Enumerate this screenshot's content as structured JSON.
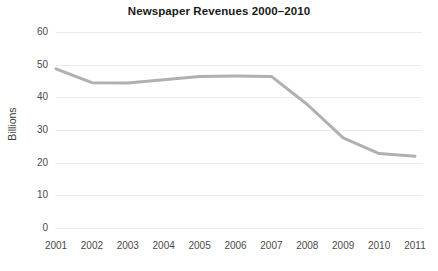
{
  "chart_data": {
    "type": "line",
    "title": "Newspaper Revenues 2000–2010",
    "xlabel": "",
    "ylabel": "Billions",
    "categories": [
      "2001",
      "2002",
      "2003",
      "2004",
      "2005",
      "2006",
      "2007",
      "2008",
      "2009",
      "2010",
      "2011"
    ],
    "x": [
      2001,
      2002,
      2003,
      2004,
      2005,
      2006,
      2007,
      2008,
      2009,
      2010,
      2011
    ],
    "values": [
      48.7,
      44.5,
      44.4,
      45.4,
      46.4,
      46.5,
      46.4,
      37.8,
      27.6,
      22.8,
      22.0
    ],
    "series": [
      {
        "name": "Newspaper Revenues",
        "values": [
          48.7,
          44.5,
          44.4,
          45.4,
          46.4,
          46.5,
          46.4,
          37.8,
          27.6,
          22.8,
          22.0
        ],
        "color": "#b0b0b0"
      }
    ],
    "ylim": [
      0,
      60
    ],
    "yticks": [
      0,
      10,
      20,
      30,
      40,
      50,
      60
    ],
    "ytick_labels": [
      "0",
      "10",
      "20",
      "30",
      "40",
      "50",
      "60"
    ],
    "grid": true,
    "grid_color": "#ebebeb",
    "legend": false,
    "legend_position": "none",
    "line_width": 3,
    "background": "#ffffff"
  },
  "axes": {
    "y_label_text": "Billions",
    "y_ticks": [
      "60",
      "50",
      "40",
      "30",
      "20",
      "10",
      "0"
    ],
    "x_ticks": [
      "2001",
      "2002",
      "2003",
      "2004",
      "2005",
      "2006",
      "2007",
      "2008",
      "2009",
      "2010",
      "2011"
    ]
  },
  "title": {
    "text": "Newspaper Revenues 2000–2010"
  }
}
